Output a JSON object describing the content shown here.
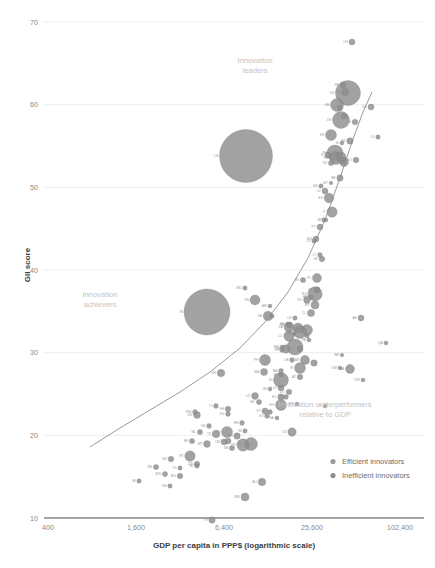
{
  "chart_data": {
    "type": "scatter",
    "title": "",
    "xlabel": "GDP per capita in PPP$ (logarithmic scale)",
    "ylabel": "GII score",
    "xscale": "log",
    "xticks": [
      "400",
      "1,600",
      "6,400",
      "25,600",
      "102,400"
    ],
    "xtick_values": [
      400,
      1600,
      6400,
      25600,
      102400
    ],
    "yticks": [
      "10",
      "20",
      "30",
      "40",
      "50",
      "60",
      "70"
    ],
    "ytick_values": [
      10,
      20,
      30,
      40,
      50,
      60,
      70
    ],
    "ylim": [
      10,
      70
    ],
    "xlim": [
      400,
      102400
    ],
    "grid": "horizontal",
    "legend_position": "bottom-right",
    "legend": [
      {
        "label": "Efficient innovators",
        "color": "#9a9a9a"
      },
      {
        "label": "Inefficient innovators",
        "color": "#8e8e8e"
      }
    ],
    "annotations": [
      {
        "id": "innovation-leaders",
        "line1": "Innovation",
        "line2": "leaders",
        "x": 255,
        "y": 63
      },
      {
        "id": "innovation-achievers",
        "line1": "Innovation",
        "line2": "achievers",
        "x": 100,
        "y": 297
      },
      {
        "id": "innovation-underperformers",
        "line1": "Innovation underperformers",
        "line2": "relative to GDP",
        "x": 325,
        "y": 407
      }
    ],
    "trendline": {
      "description": "fitted power curve of GII score versus GDP per capita",
      "points": [
        [
          90,
          447
        ],
        [
          120,
          428
        ],
        [
          150,
          410
        ],
        [
          180,
          392
        ],
        [
          210,
          372
        ],
        [
          240,
          348
        ],
        [
          265,
          322
        ],
        [
          288,
          292
        ],
        [
          308,
          258
        ],
        [
          325,
          220
        ],
        [
          340,
          178
        ],
        [
          352,
          142
        ],
        [
          363,
          112
        ],
        [
          372,
          92
        ]
      ]
    },
    "bubble_note": "bubble area is proportional to population",
    "points": [
      {
        "label": "CN",
        "gdp": 9300,
        "gii": 53.1,
        "r": 26.5,
        "x": 246,
        "y": 156
      },
      {
        "label": "IN",
        "gdp": 5100,
        "gii": 35.6,
        "r": 23.0,
        "x": 207,
        "y": 312
      },
      {
        "label": "US",
        "gdp": 54000,
        "gii": 61.4,
        "r": 12.5,
        "x": 348,
        "y": 93
      },
      {
        "label": "JP",
        "gdp": 38000,
        "gii": 54.7,
        "r": 8.0,
        "x": 335,
        "y": 153
      },
      {
        "label": "DE",
        "gdp": 46000,
        "gii": 58.0,
        "r": 8.5,
        "x": 341,
        "y": 120
      },
      {
        "label": "GB",
        "gdp": 41000,
        "gii": 60.1,
        "r": 6.5,
        "x": 337,
        "y": 105
      },
      {
        "label": "FR",
        "gdp": 40000,
        "gii": 54.0,
        "r": 6.5,
        "x": 336,
        "y": 158
      },
      {
        "label": "KR",
        "gdp": 35000,
        "gii": 56.6,
        "r": 5.5,
        "x": 331,
        "y": 135
      },
      {
        "label": "CH",
        "gdp": 59000,
        "gii": 67.7,
        "r": 3.0,
        "x": 352,
        "y": 42
      },
      {
        "label": "SE",
        "gdp": 47000,
        "gii": 62.5,
        "r": 3.0,
        "x": 343,
        "y": 85
      },
      {
        "label": "NL",
        "gdp": 49000,
        "gii": 61.6,
        "r": 3.5,
        "x": 345,
        "y": 92
      },
      {
        "label": "SG",
        "gdp": 84000,
        "gii": 59.8,
        "r": 3.0,
        "x": 371,
        "y": 107
      },
      {
        "label": "FI",
        "gdp": 41000,
        "gii": 59.8,
        "r": 2.8,
        "x": 340,
        "y": 108
      },
      {
        "label": "DK",
        "gdp": 46000,
        "gii": 58.7,
        "r": 2.8,
        "x": 344,
        "y": 116
      },
      {
        "label": "IE",
        "gdp": 60000,
        "gii": 57.9,
        "r": 2.8,
        "x": 355,
        "y": 122
      },
      {
        "label": "LU",
        "gdp": 95000,
        "gii": 56.4,
        "r": 2.2,
        "x": 378,
        "y": 137
      },
      {
        "label": "NO",
        "gdp": 62000,
        "gii": 53.1,
        "r": 2.8,
        "x": 356,
        "y": 160
      },
      {
        "label": "AT",
        "gdp": 46000,
        "gii": 53.1,
        "r": 3.2,
        "x": 343,
        "y": 161
      },
      {
        "label": "BE",
        "gdp": 43000,
        "gii": 51.0,
        "r": 3.2,
        "x": 340,
        "y": 178
      },
      {
        "label": "CA",
        "gdp": 44000,
        "gii": 53.7,
        "r": 5.0,
        "x": 341,
        "y": 157
      },
      {
        "label": "AU",
        "gdp": 46000,
        "gii": 53.1,
        "r": 4.5,
        "x": 344,
        "y": 162
      },
      {
        "label": "IL",
        "gdp": 33000,
        "gii": 53.9,
        "r": 3.2,
        "x": 328,
        "y": 155
      },
      {
        "label": "NZ",
        "gdp": 35000,
        "gii": 52.9,
        "r": 2.6,
        "x": 331,
        "y": 163
      },
      {
        "label": "IS",
        "gdp": 45000,
        "gii": 55.6,
        "r": 2.0,
        "x": 342,
        "y": 143
      },
      {
        "label": "HK",
        "gdp": 56000,
        "gii": 55.7,
        "r": 3.2,
        "x": 350,
        "y": 141
      },
      {
        "label": "EE",
        "gdp": 28000,
        "gii": 50.1,
        "r": 2.2,
        "x": 321,
        "y": 186
      },
      {
        "label": "CZ",
        "gdp": 31000,
        "gii": 49.4,
        "r": 3.0,
        "x": 325,
        "y": 191
      },
      {
        "label": "ES",
        "gdp": 34000,
        "gii": 48.8,
        "r": 4.8,
        "x": 329,
        "y": 198
      },
      {
        "label": "IT",
        "gdp": 36000,
        "gii": 47.2,
        "r": 5.2,
        "x": 332,
        "y": 212
      },
      {
        "label": "SI",
        "gdp": 30000,
        "gii": 46.3,
        "r": 2.2,
        "x": 324,
        "y": 220
      },
      {
        "label": "MT",
        "gdp": 35000,
        "gii": 50.5,
        "r": 1.8,
        "x": 331,
        "y": 183
      },
      {
        "label": "CY",
        "gdp": 32000,
        "gii": 46.3,
        "r": 1.9,
        "x": 326,
        "y": 220
      },
      {
        "label": "PT",
        "gdp": 28000,
        "gii": 45.6,
        "r": 3.0,
        "x": 320,
        "y": 227
      },
      {
        "label": "SK",
        "gdp": 29000,
        "gii": 42.2,
        "r": 2.8,
        "x": 322,
        "y": 259
      },
      {
        "label": "HU",
        "gdp": 25000,
        "gii": 44.3,
        "r": 3.0,
        "x": 316,
        "y": 239
      },
      {
        "label": "LV",
        "gdp": 24000,
        "gii": 44.1,
        "r": 2.2,
        "x": 314,
        "y": 241
      },
      {
        "label": "LT",
        "gdp": 28000,
        "gii": 42.6,
        "r": 2.4,
        "x": 320,
        "y": 255
      },
      {
        "label": "PL",
        "gdp": 26000,
        "gii": 40.2,
        "r": 4.5,
        "x": 317,
        "y": 278
      },
      {
        "label": "GR",
        "gdp": 26000,
        "gii": 39.0,
        "r": 3.2,
        "x": 317,
        "y": 290
      },
      {
        "label": "HR",
        "gdp": 22000,
        "gii": 38.3,
        "r": 2.4,
        "x": 311,
        "y": 297
      },
      {
        "label": "RU",
        "gdp": 25000,
        "gii": 38.5,
        "r": 7.2,
        "x": 315,
        "y": 294
      },
      {
        "label": "BG",
        "gdp": 18000,
        "gii": 40.0,
        "r": 2.6,
        "x": 303,
        "y": 280
      },
      {
        "label": "RO",
        "gdp": 20000,
        "gii": 37.9,
        "r": 3.4,
        "x": 307,
        "y": 300
      },
      {
        "label": "MY",
        "gdp": 25000,
        "gii": 37.4,
        "r": 4.0,
        "x": 315,
        "y": 305
      },
      {
        "label": "TR",
        "gdp": 20000,
        "gii": 34.8,
        "r": 5.5,
        "x": 307,
        "y": 330
      },
      {
        "label": "MX",
        "gdp": 17000,
        "gii": 34.6,
        "r": 6.5,
        "x": 300,
        "y": 332
      },
      {
        "label": "CL",
        "gdp": 22000,
        "gii": 36.6,
        "r": 3.6,
        "x": 311,
        "y": 313
      },
      {
        "label": "AR",
        "gdp": 19000,
        "gii": 31.8,
        "r": 4.5,
        "x": 305,
        "y": 360
      },
      {
        "label": "BR",
        "gdp": 15000,
        "gii": 33.1,
        "r": 8.0,
        "x": 295,
        "y": 347
      },
      {
        "label": "CR",
        "gdp": 15000,
        "gii": 36.1,
        "r": 2.2,
        "x": 295,
        "y": 318
      },
      {
        "label": "UY",
        "gdp": 20000,
        "gii": 34.2,
        "r": 2.2,
        "x": 307,
        "y": 336
      },
      {
        "label": "PA",
        "gdp": 21000,
        "gii": 33.8,
        "r": 2.0,
        "x": 309,
        "y": 340
      },
      {
        "label": "TH",
        "gdp": 16000,
        "gii": 35.0,
        "r": 5.0,
        "x": 298,
        "y": 328
      },
      {
        "label": "ZA",
        "gdp": 13000,
        "gii": 35.1,
        "r": 5.0,
        "x": 289,
        "y": 327
      },
      {
        "label": "CO",
        "gdp": 13000,
        "gii": 34.2,
        "r": 5.2,
        "x": 289,
        "y": 336
      },
      {
        "label": "PE",
        "gdp": 12000,
        "gii": 32.9,
        "r": 4.2,
        "x": 286,
        "y": 349
      },
      {
        "label": "UA",
        "gdp": 8000,
        "gii": 36.3,
        "r": 4.8,
        "x": 268,
        "y": 316
      },
      {
        "label": "MD",
        "gdp": 5000,
        "gii": 39.2,
        "r": 2.2,
        "x": 245,
        "y": 288
      },
      {
        "label": "AM",
        "gdp": 8500,
        "gii": 37.3,
        "r": 2.0,
        "x": 270,
        "y": 306
      },
      {
        "label": "GE",
        "gdp": 9000,
        "gii": 36.3,
        "r": 2.2,
        "x": 272,
        "y": 316
      },
      {
        "label": "MN",
        "gdp": 11000,
        "gii": 33.1,
        "r": 2.0,
        "x": 282,
        "y": 347
      },
      {
        "label": "VN",
        "gdp": 6000,
        "gii": 37.9,
        "r": 5.0,
        "x": 255,
        "y": 300
      },
      {
        "label": "PH",
        "gdp": 7500,
        "gii": 31.8,
        "r": 5.5,
        "x": 265,
        "y": 360
      },
      {
        "label": "ID",
        "gdp": 11000,
        "gii": 29.8,
        "r": 7.5,
        "x": 281,
        "y": 380
      },
      {
        "label": "IR",
        "gdp": 17000,
        "gii": 31.0,
        "r": 5.5,
        "x": 300,
        "y": 368
      },
      {
        "label": "EG",
        "gdp": 11000,
        "gii": 27.2,
        "r": 5.5,
        "x": 281,
        "y": 405
      },
      {
        "label": "LK",
        "gdp": 11000,
        "gii": 29.0,
        "r": 3.0,
        "x": 281,
        "y": 388
      },
      {
        "label": "MA",
        "gdp": 7500,
        "gii": 30.6,
        "r": 3.5,
        "x": 264,
        "y": 372
      },
      {
        "label": "TN",
        "gdp": 11000,
        "gii": 32.9,
        "r": 2.4,
        "x": 282,
        "y": 350
      },
      {
        "label": "JO",
        "gdp": 12000,
        "gii": 28.0,
        "r": 2.4,
        "x": 286,
        "y": 397
      },
      {
        "label": "SA",
        "gdp": 52000,
        "gii": 30.8,
        "r": 4.5,
        "x": 350,
        "y": 369
      },
      {
        "label": "AE",
        "gdp": 67000,
        "gii": 36.0,
        "r": 3.0,
        "x": 361,
        "y": 318
      },
      {
        "label": "QA",
        "gdp": 125000,
        "gii": 33.4,
        "r": 2.0,
        "x": 386,
        "y": 343
      },
      {
        "label": "KW",
        "gdp": 70000,
        "gii": 29.8,
        "r": 2.0,
        "x": 363,
        "y": 380
      },
      {
        "label": "OM",
        "gdp": 43000,
        "gii": 31.0,
        "r": 2.0,
        "x": 340,
        "y": 368
      },
      {
        "label": "BH",
        "gdp": 45000,
        "gii": 32.4,
        "r": 1.8,
        "x": 342,
        "y": 355
      },
      {
        "label": "KZ",
        "gdp": 24000,
        "gii": 31.5,
        "r": 3.2,
        "x": 314,
        "y": 363
      },
      {
        "label": "AZ",
        "gdp": 17000,
        "gii": 30.1,
        "r": 2.8,
        "x": 300,
        "y": 377
      },
      {
        "label": "BY",
        "gdp": 17000,
        "gii": 32.9,
        "r": 3.0,
        "x": 300,
        "y": 349
      },
      {
        "label": "BA",
        "gdp": 11000,
        "gii": 30.7,
        "r": 2.4,
        "x": 281,
        "y": 371
      },
      {
        "label": "RS",
        "gdp": 13000,
        "gii": 35.3,
        "r": 2.8,
        "x": 289,
        "y": 325
      },
      {
        "label": "MK",
        "gdp": 13000,
        "gii": 35.4,
        "r": 2.0,
        "x": 288,
        "y": 324
      },
      {
        "label": "AL",
        "gdp": 11000,
        "gii": 30.3,
        "r": 2.0,
        "x": 281,
        "y": 375
      },
      {
        "label": "ME",
        "gdp": 15000,
        "gii": 34.4,
        "r": 1.8,
        "x": 294,
        "y": 334
      },
      {
        "label": "GT",
        "gdp": 7500,
        "gii": 26.5,
        "r": 3.0,
        "x": 265,
        "y": 411
      },
      {
        "label": "SV",
        "gdp": 8000,
        "gii": 26.0,
        "r": 2.4,
        "x": 267,
        "y": 416
      },
      {
        "label": "HN",
        "gdp": 4700,
        "gii": 25.3,
        "r": 2.4,
        "x": 242,
        "y": 423
      },
      {
        "label": "NI",
        "gdp": 5000,
        "gii": 24.5,
        "r": 2.2,
        "x": 245,
        "y": 431
      },
      {
        "label": "PY",
        "gdp": 8500,
        "gii": 26.4,
        "r": 2.4,
        "x": 270,
        "y": 412
      },
      {
        "label": "BO",
        "gdp": 6500,
        "gii": 27.5,
        "r": 2.6,
        "x": 259,
        "y": 402
      },
      {
        "label": "EC",
        "gdp": 11000,
        "gii": 28.0,
        "r": 3.2,
        "x": 281,
        "y": 397
      },
      {
        "label": "DO",
        "gdp": 13000,
        "gii": 28.5,
        "r": 2.8,
        "x": 289,
        "y": 392
      },
      {
        "label": "JM",
        "gdp": 8500,
        "gii": 28.8,
        "r": 2.0,
        "x": 270,
        "y": 389
      },
      {
        "label": "NA",
        "gdp": 10000,
        "gii": 25.8,
        "r": 2.0,
        "x": 277,
        "y": 418
      },
      {
        "label": "BW",
        "gdp": 16000,
        "gii": 27.3,
        "r": 2.0,
        "x": 297,
        "y": 404
      },
      {
        "label": "KE",
        "gdp": 3000,
        "gii": 30.5,
        "r": 3.8,
        "x": 221,
        "y": 373
      },
      {
        "label": "TZ",
        "gdp": 2700,
        "gii": 24.2,
        "r": 3.8,
        "x": 216,
        "y": 434
      },
      {
        "label": "UG",
        "gdp": 1900,
        "gii": 26.1,
        "r": 3.4,
        "x": 197,
        "y": 415
      },
      {
        "label": "RW",
        "gdp": 1800,
        "gii": 26.4,
        "r": 2.4,
        "x": 195,
        "y": 412
      },
      {
        "label": "SN",
        "gdp": 2400,
        "gii": 25.0,
        "r": 2.4,
        "x": 209,
        "y": 426
      },
      {
        "label": "ML",
        "gdp": 2000,
        "gii": 24.4,
        "r": 2.6,
        "x": 200,
        "y": 432
      },
      {
        "label": "BF",
        "gdp": 1700,
        "gii": 23.5,
        "r": 2.6,
        "x": 192,
        "y": 441
      },
      {
        "label": "NE",
        "gdp": 950,
        "gii": 20.9,
        "r": 2.6,
        "x": 156,
        "y": 467
      },
      {
        "label": "ET",
        "gdp": 1600,
        "gii": 22.0,
        "r": 5.2,
        "x": 190,
        "y": 456
      },
      {
        "label": "NG",
        "gdp": 5700,
        "gii": 23.2,
        "r": 6.5,
        "x": 251,
        "y": 444
      },
      {
        "label": "GH",
        "gdp": 4200,
        "gii": 24.0,
        "r": 3.2,
        "x": 237,
        "y": 436
      },
      {
        "label": "CI",
        "gdp": 3400,
        "gii": 23.5,
        "r": 3.0,
        "x": 228,
        "y": 441
      },
      {
        "label": "CM",
        "gdp": 3100,
        "gii": 23.4,
        "r": 3.0,
        "x": 224,
        "y": 442
      },
      {
        "label": "ZM",
        "gdp": 3700,
        "gii": 22.8,
        "r": 2.6,
        "x": 232,
        "y": 448
      },
      {
        "label": "ZW",
        "gdp": 1900,
        "gii": 21.2,
        "r": 2.8,
        "x": 197,
        "y": 464
      },
      {
        "label": "MW",
        "gdp": 1100,
        "gii": 20.2,
        "r": 2.6,
        "x": 165,
        "y": 474
      },
      {
        "label": "MZ",
        "gdp": 1200,
        "gii": 21.7,
        "r": 2.8,
        "x": 171,
        "y": 459
      },
      {
        "label": "MG",
        "gdp": 1400,
        "gii": 20.0,
        "r": 2.8,
        "x": 180,
        "y": 476
      },
      {
        "label": "BI",
        "gdp": 750,
        "gii": 19.5,
        "r": 2.2,
        "x": 139,
        "y": 481
      },
      {
        "label": "BD",
        "gdp": 3300,
        "gii": 24.4,
        "r": 5.5,
        "x": 227,
        "y": 432
      },
      {
        "label": "PK",
        "gdp": 4800,
        "gii": 23.1,
        "r": 6.2,
        "x": 243,
        "y": 445
      },
      {
        "label": "NP",
        "gdp": 2300,
        "gii": 23.1,
        "r": 3.4,
        "x": 207,
        "y": 444
      },
      {
        "label": "KH",
        "gdp": 3400,
        "gii": 26.7,
        "r": 2.8,
        "x": 228,
        "y": 409
      },
      {
        "label": "MM",
        "gdp": 5000,
        "gii": 18.0,
        "r": 4.0,
        "x": 245,
        "y": 497
      },
      {
        "label": "TJ",
        "gdp": 2700,
        "gii": 27.0,
        "r": 2.4,
        "x": 216,
        "y": 406
      },
      {
        "label": "KG",
        "gdp": 3400,
        "gii": 26.2,
        "r": 2.4,
        "x": 228,
        "y": 414
      },
      {
        "label": "UZ",
        "gdp": 6000,
        "gii": 28.1,
        "r": 3.4,
        "x": 255,
        "y": 396
      },
      {
        "label": "YE",
        "gdp": 2500,
        "gii": 15.6,
        "r": 3.2,
        "x": 212,
        "y": 520
      },
      {
        "label": "TG",
        "gdp": 1400,
        "gii": 20.8,
        "r": 2.2,
        "x": 180,
        "y": 468
      },
      {
        "label": "BJ",
        "gdp": 1900,
        "gii": 21.0,
        "r": 2.2,
        "x": 197,
        "y": 466
      },
      {
        "label": "GN",
        "gdp": 1200,
        "gii": 19.0,
        "r": 2.2,
        "x": 170,
        "y": 486
      },
      {
        "label": "TT",
        "gdp": 31000,
        "gii": 27.1,
        "r": 2.0,
        "x": 325,
        "y": 406
      },
      {
        "label": "LB",
        "gdp": 14000,
        "gii": 31.8,
        "r": 2.4,
        "x": 292,
        "y": 360
      },
      {
        "label": "DZ",
        "gdp": 14000,
        "gii": 24.4,
        "r": 4.2,
        "x": 292,
        "y": 432
      },
      {
        "label": "AO",
        "gdp": 7000,
        "gii": 19.4,
        "r": 3.8,
        "x": 262,
        "y": 482
      }
    ]
  }
}
